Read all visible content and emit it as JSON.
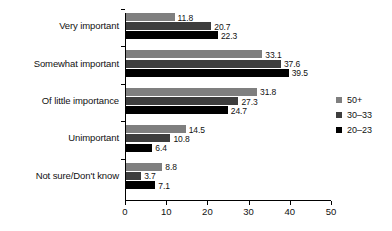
{
  "chart_data": {
    "type": "bar",
    "orientation": "horizontal",
    "title": "",
    "subtitle": "",
    "xlabel": "",
    "ylabel": "",
    "categories": [
      "Very important",
      "Somewhat important",
      "Of little importance",
      "Unimportant",
      "Not sure/Don't know"
    ],
    "series": [
      {
        "name": "50+",
        "color": "#7f7f7f",
        "values": [
          11.8,
          33.1,
          31.8,
          14.5,
          8.8
        ]
      },
      {
        "name": "30–33",
        "color": "#3d3d3d",
        "values": [
          20.7,
          37.6,
          27.3,
          10.8,
          3.7
        ]
      },
      {
        "name": "20–23",
        "color": "#000000",
        "values": [
          22.3,
          39.5,
          24.7,
          6.4,
          7.1
        ]
      }
    ],
    "xlim": [
      0,
      50
    ],
    "xticks": [
      0,
      10,
      20,
      30,
      40,
      50
    ],
    "xticklabels": [
      "0",
      "10",
      "20",
      "30",
      "40",
      "50"
    ],
    "grid": false,
    "data_labels": true,
    "legend": {
      "position": "right",
      "entries": [
        "50+",
        "30–33",
        "20–23"
      ]
    }
  }
}
